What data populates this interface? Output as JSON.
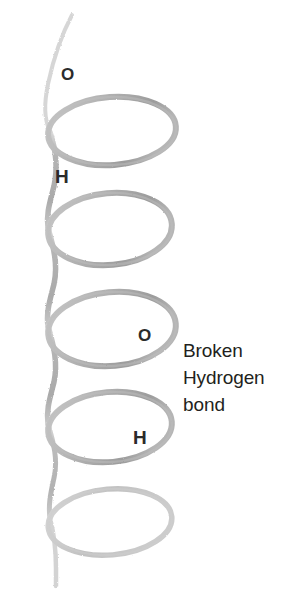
{
  "figure": {
    "background_color": "#ffffff",
    "width": 306,
    "height": 608
  },
  "annotation": {
    "lines": [
      "Broken",
      "Hydrogen",
      "bond"
    ],
    "full_text": "Broken Hydrogen bond",
    "color": "#231f20"
  },
  "atom_labels": [
    {
      "id": "o-top",
      "text": "O",
      "element": "oxygen",
      "x": 61,
      "y": 66
    },
    {
      "id": "h-top",
      "text": "H",
      "element": "hydrogen",
      "x": 55,
      "y": 167
    },
    {
      "id": "o-mid",
      "text": "O",
      "element": "oxygen",
      "x": 138,
      "y": 327
    },
    {
      "id": "h-low",
      "text": "H",
      "element": "hydrogen",
      "x": 133,
      "y": 428
    }
  ],
  "helix": {
    "style": "pencil-sketch",
    "stroke_color_light": "#c4c4c4",
    "stroke_color_mid": "#aaaaaa",
    "stroke_color_dark": "#9a9a9a",
    "coil_count": 5,
    "coils": [
      {
        "index": 1,
        "cx": 112,
        "cy": 131,
        "rx": 64,
        "ry": 34
      },
      {
        "index": 2,
        "cx": 110,
        "cy": 229,
        "rx": 62,
        "ry": 36
      },
      {
        "index": 3,
        "cx": 112,
        "cy": 329,
        "rx": 64,
        "ry": 37
      },
      {
        "index": 4,
        "cx": 110,
        "cy": 427,
        "rx": 62,
        "ry": 35
      },
      {
        "index": 5,
        "cx": 110,
        "cy": 522,
        "rx": 62,
        "ry": 33
      }
    ],
    "top_tail": {
      "x1": 72,
      "y1": 14,
      "x2": 48,
      "y2": 120
    },
    "bottom_tail": {
      "x1": 50,
      "y1": 520,
      "x2": 56,
      "y2": 586
    }
  }
}
